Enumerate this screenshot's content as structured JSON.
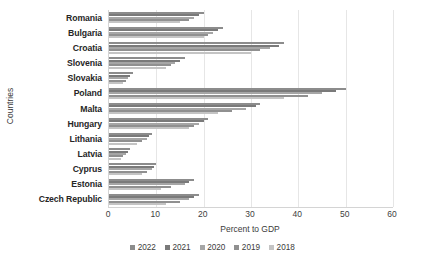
{
  "chart_data": {
    "type": "bar",
    "orientation": "horizontal",
    "title": "",
    "xlabel": "Percent to GDP",
    "ylabel": "Countries",
    "xlim": [
      0,
      60
    ],
    "xticks": [
      0,
      10,
      20,
      30,
      40,
      50,
      60
    ],
    "grid": true,
    "legend_position": "bottom",
    "categories": [
      "Romania",
      "Bulgaria",
      "Croatia",
      "Slovenia",
      "Slovakia",
      "Poland",
      "Malta",
      "Hungary",
      "Lithania",
      "Latvia",
      "Cyprus",
      "Estonia",
      "Czech Republic"
    ],
    "series": [
      {
        "name": "2022",
        "color": "#8c8c8c",
        "values": [
          20,
          24,
          37,
          16,
          5,
          50,
          32,
          21,
          9,
          4.5,
          10,
          18,
          19
        ]
      },
      {
        "name": "2021",
        "color": "#7a7a7a",
        "values": [
          19,
          23,
          36,
          15,
          4.5,
          48,
          31,
          20,
          8.5,
          4,
          9.5,
          17,
          18
        ]
      },
      {
        "name": "2020",
        "color": "#a6a6a6",
        "values": [
          18,
          22,
          34,
          14,
          4,
          45,
          29,
          19,
          8,
          3.5,
          9,
          16,
          17
        ]
      },
      {
        "name": "2019",
        "color": "#909090",
        "values": [
          17,
          21,
          32,
          13,
          3.5,
          42,
          26,
          18,
          7,
          3,
          8,
          13,
          15
        ]
      },
      {
        "name": "2018",
        "color": "#c4c4c4",
        "values": [
          15,
          20,
          30,
          12,
          3,
          37,
          23,
          17,
          6,
          2.5,
          7,
          11,
          12
        ]
      }
    ]
  },
  "axes": {
    "x_title": "Percent to GDP",
    "y_title": "Countries"
  }
}
